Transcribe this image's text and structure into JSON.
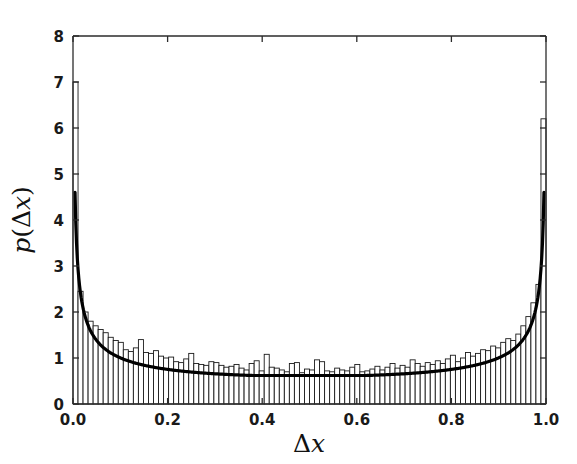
{
  "figure": {
    "background_color": "#ffffff",
    "width": 577,
    "height": 464
  },
  "axes": {
    "frame_color": "#2b2b2b",
    "x_label_delta": "Δ",
    "x_label_var": "x",
    "y_label_p": "p",
    "y_label_open": "(",
    "y_label_delta": "Δ",
    "y_label_var": "x",
    "y_label_close": ")",
    "x_ticks": [
      "0.0",
      "0.2",
      "0.4",
      "0.6",
      "0.8",
      "1.0"
    ],
    "y_ticks": [
      "0",
      "1",
      "2",
      "3",
      "4",
      "5",
      "6",
      "7",
      "8"
    ]
  },
  "chart_data": {
    "type": "bar",
    "title": "",
    "subtitle": "",
    "xlabel": "Δx",
    "ylabel": "p(Δx)",
    "xlim": [
      0.0,
      1.0
    ],
    "ylim": [
      0,
      8
    ],
    "grid": false,
    "legend": null,
    "bar_style": {
      "facecolor": "#ffffff",
      "edgecolor": "#1a1a1a",
      "edge_width": 0.9
    },
    "bin_count": 94,
    "bin_width": 0.010638,
    "categories": [
      0.0053,
      0.016,
      0.0266,
      0.0372,
      0.0479,
      0.0585,
      0.0691,
      0.0798,
      0.0904,
      0.1011,
      0.1117,
      0.1223,
      0.133,
      0.1436,
      0.1543,
      0.1649,
      0.1755,
      0.1862,
      0.1968,
      0.2074,
      0.2181,
      0.2287,
      0.2394,
      0.25,
      0.2606,
      0.2713,
      0.2819,
      0.2926,
      0.3032,
      0.3138,
      0.3245,
      0.3351,
      0.3457,
      0.3564,
      0.367,
      0.3777,
      0.3883,
      0.3989,
      0.4096,
      0.4202,
      0.4309,
      0.4415,
      0.4521,
      0.4628,
      0.4734,
      0.484,
      0.4947,
      0.5053,
      0.516,
      0.5266,
      0.5372,
      0.5479,
      0.5585,
      0.5691,
      0.5798,
      0.5904,
      0.6011,
      0.6117,
      0.6223,
      0.633,
      0.6436,
      0.6543,
      0.6649,
      0.6755,
      0.6862,
      0.6968,
      0.7074,
      0.7181,
      0.7287,
      0.7394,
      0.75,
      0.7606,
      0.7713,
      0.7819,
      0.7926,
      0.8032,
      0.8138,
      0.8245,
      0.8351,
      0.8457,
      0.8564,
      0.867,
      0.8777,
      0.8883,
      0.8989,
      0.9096,
      0.9202,
      0.9309,
      0.9415,
      0.9521,
      0.9628,
      0.9734,
      0.984,
      0.9947
    ],
    "values": [
      7.0,
      2.45,
      2.0,
      1.8,
      1.7,
      1.62,
      1.55,
      1.45,
      1.38,
      1.34,
      1.18,
      1.14,
      1.22,
      1.4,
      1.12,
      1.1,
      1.16,
      1.04,
      1.0,
      1.02,
      0.92,
      0.9,
      0.98,
      1.1,
      0.88,
      0.86,
      0.84,
      0.92,
      0.9,
      0.84,
      0.8,
      0.82,
      0.86,
      0.78,
      0.74,
      0.88,
      0.94,
      0.72,
      1.08,
      0.8,
      0.78,
      0.74,
      0.7,
      0.88,
      0.9,
      0.68,
      0.76,
      0.74,
      0.96,
      0.92,
      0.72,
      0.7,
      0.78,
      0.74,
      0.72,
      0.8,
      0.86,
      0.7,
      0.72,
      0.76,
      0.82,
      0.74,
      0.8,
      0.88,
      0.78,
      0.84,
      0.8,
      0.96,
      0.88,
      0.82,
      0.9,
      0.86,
      0.94,
      0.88,
      0.98,
      1.06,
      0.92,
      1.0,
      1.12,
      1.04,
      1.1,
      1.18,
      1.16,
      1.26,
      1.22,
      1.34,
      1.42,
      1.38,
      1.52,
      1.7,
      1.9,
      2.2,
      2.6,
      6.2
    ],
    "curve": {
      "name": "arcsine-density fit",
      "color": "#000000",
      "linewidth": 3.2,
      "x_start": 0.0043,
      "x_end": 0.9957,
      "y_at_start": 4.6,
      "y_at_end": 4.6,
      "y_min": 0.62,
      "formula_note": "p(dx) = c / sqrt(dx*(1-dx)) style U-shaped density"
    }
  }
}
